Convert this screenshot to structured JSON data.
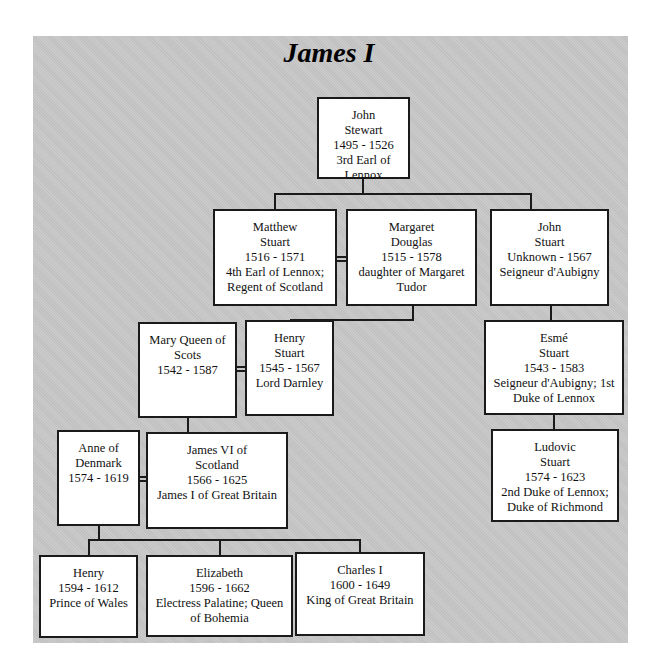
{
  "diagram": {
    "title": "James I",
    "people": {
      "john_stewart": {
        "lines": [
          "John",
          "Stewart",
          "1495 - 1526",
          "3rd Earl of Lennox"
        ]
      },
      "matthew_stuart": {
        "lines": [
          "Matthew",
          "Stuart",
          "1516 - 1571",
          "4th Earl of Lennox;",
          "Regent of Scotland"
        ]
      },
      "margaret_douglas": {
        "lines": [
          "Margaret",
          "Douglas",
          "1515 - 1578",
          "daughter of Margaret",
          "Tudor"
        ]
      },
      "john_stuart": {
        "lines": [
          "John",
          "Stuart",
          "Unknown - 1567",
          "Seigneur d'Aubigny"
        ]
      },
      "mary_queen_of_scots": {
        "lines": [
          "Mary Queen of",
          "Scots",
          "1542 - 1587"
        ]
      },
      "henry_stuart": {
        "lines": [
          "Henry",
          "Stuart",
          "1545 - 1567",
          "Lord Darnley"
        ]
      },
      "esme_stuart": {
        "lines": [
          "Esmé",
          "Stuart",
          "1543 - 1583",
          "Seigneur d'Aubigny; 1st",
          "Duke of Lennox"
        ]
      },
      "anne_of_denmark": {
        "lines": [
          "Anne of",
          "Denmark",
          "1574 - 1619"
        ]
      },
      "james_vi": {
        "lines": [
          "James VI of",
          "Scotland",
          "1566 - 1625",
          "James I of Great Britain"
        ]
      },
      "ludovic_stuart": {
        "lines": [
          "Ludovic",
          "Stuart",
          "1574 - 1623",
          "2nd Duke of Lennox;",
          "Duke of Richmond"
        ]
      },
      "henry_prince": {
        "lines": [
          "Henry",
          "1594 - 1612",
          "Prince of Wales"
        ]
      },
      "elizabeth": {
        "lines": [
          "Elizabeth",
          "1596 - 1662",
          "Electress Palatine; Queen",
          "of Bohemia"
        ]
      },
      "charles_i": {
        "lines": [
          "Charles I",
          "1600 - 1649",
          "King of Great Britain"
        ]
      }
    },
    "relationships": [
      {
        "type": "parent",
        "from": "john_stewart",
        "to": [
          "matthew_stuart",
          "john_stuart"
        ]
      },
      {
        "type": "marriage",
        "between": [
          "matthew_stuart",
          "margaret_douglas"
        ]
      },
      {
        "type": "parent",
        "from": "margaret_douglas",
        "to": [
          "henry_stuart"
        ]
      },
      {
        "type": "marriage",
        "between": [
          "mary_queen_of_scots",
          "henry_stuart"
        ]
      },
      {
        "type": "parent",
        "from": "john_stuart",
        "to": [
          "esme_stuart"
        ]
      },
      {
        "type": "parent",
        "from": "mary_queen_of_scots",
        "to": [
          "james_vi"
        ]
      },
      {
        "type": "marriage",
        "between": [
          "anne_of_denmark",
          "james_vi"
        ]
      },
      {
        "type": "parent",
        "from": "esme_stuart",
        "to": [
          "ludovic_stuart"
        ]
      },
      {
        "type": "parent",
        "from": "anne_of_denmark",
        "to": [
          "henry_prince",
          "elizabeth",
          "charles_i"
        ]
      }
    ]
  }
}
